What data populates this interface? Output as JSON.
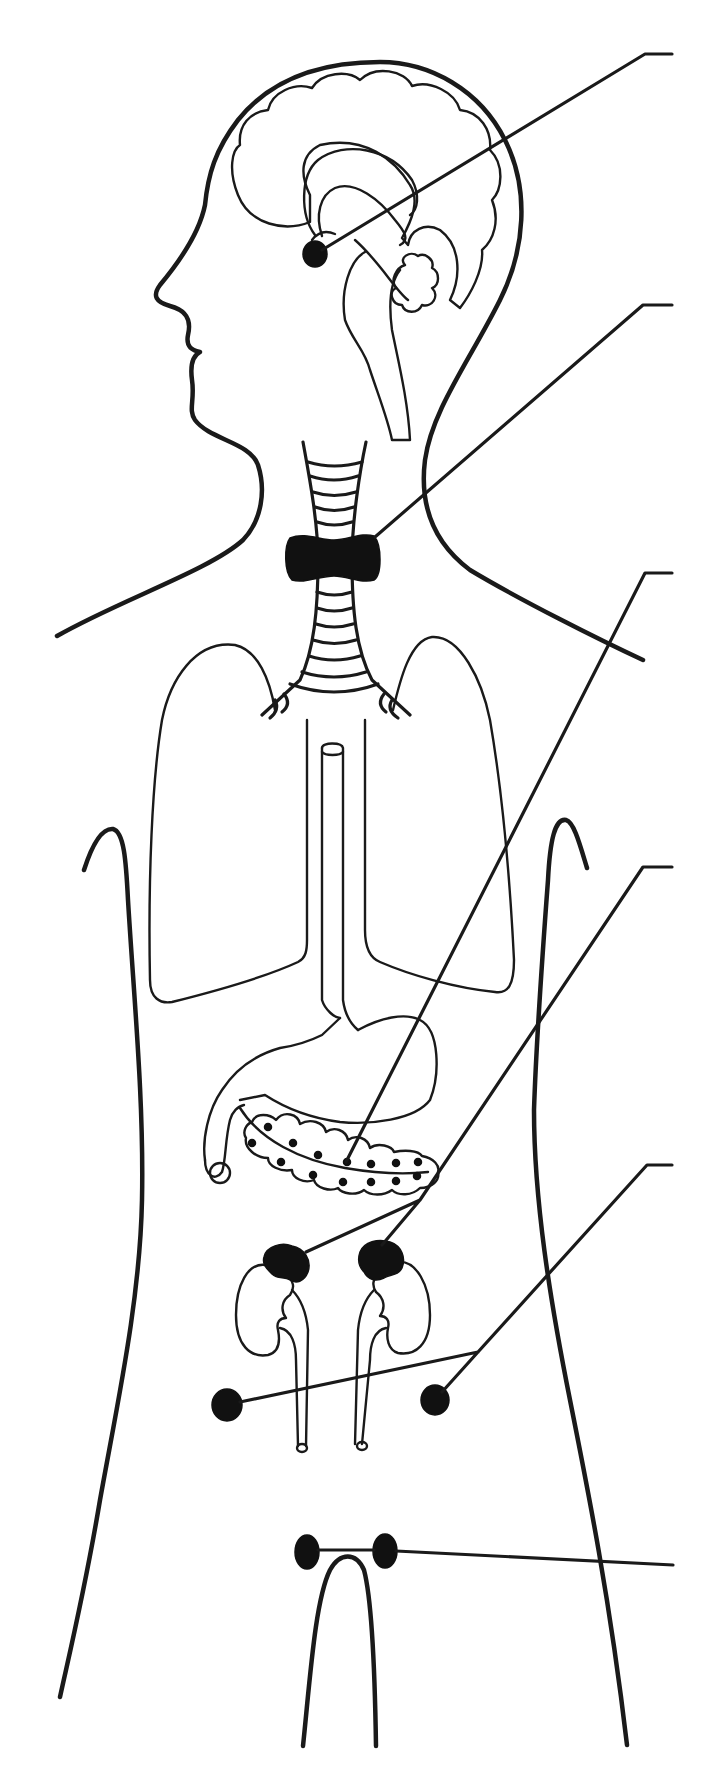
{
  "diagram": {
    "colors": {
      "ink": "#1a1a1a",
      "gland_fill": "#111111",
      "background": "#ffffff"
    },
    "labels": [
      {
        "id": "label-1",
        "target": "pituitary-gland",
        "text": ""
      },
      {
        "id": "label-2",
        "target": "thyroid-gland",
        "text": ""
      },
      {
        "id": "label-3",
        "target": "pancreas",
        "text": ""
      },
      {
        "id": "label-4",
        "target": "adrenal-glands",
        "text": ""
      },
      {
        "id": "label-5",
        "target": "ovaries",
        "text": ""
      },
      {
        "id": "label-6",
        "target": "testes",
        "text": ""
      }
    ],
    "label_count": 6
  }
}
